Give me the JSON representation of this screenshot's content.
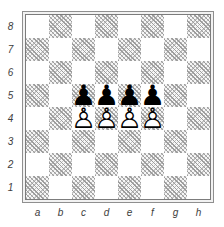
{
  "diagram": {
    "type": "chess-position",
    "files_left_to_right": [
      "a",
      "b",
      "c",
      "d",
      "e",
      "f",
      "g",
      "h"
    ],
    "ranks_top_to_bottom": [
      "8",
      "7",
      "6",
      "5",
      "4",
      "3",
      "2",
      "1"
    ],
    "pieces": [
      {
        "square": "c5",
        "color": "black",
        "type": "pawn",
        "glyph_solid": "♟",
        "glyph_outline": "♙"
      },
      {
        "square": "d5",
        "color": "black",
        "type": "pawn",
        "glyph_solid": "♟",
        "glyph_outline": "♙"
      },
      {
        "square": "e5",
        "color": "black",
        "type": "pawn",
        "glyph_solid": "♟",
        "glyph_outline": "♙"
      },
      {
        "square": "f5",
        "color": "black",
        "type": "pawn",
        "glyph_solid": "♟",
        "glyph_outline": "♙"
      },
      {
        "square": "c4",
        "color": "white",
        "type": "pawn",
        "glyph_solid": "♟",
        "glyph_outline": "♙"
      },
      {
        "square": "d4",
        "color": "white",
        "type": "pawn",
        "glyph_solid": "♟",
        "glyph_outline": "♙"
      },
      {
        "square": "e4",
        "color": "white",
        "type": "pawn",
        "glyph_solid": "♟",
        "glyph_outline": "♙"
      },
      {
        "square": "f4",
        "color": "white",
        "type": "pawn",
        "glyph_solid": "♟",
        "glyph_outline": "♙"
      }
    ],
    "colors": {
      "light_square": "#ffffff",
      "dark_square_background": "#f6f6f6",
      "dark_square_hatch_primary": "#9d9d9d",
      "dark_square_hatch_secondary": "#c2c2c2",
      "frame_outer_line": "#8f8f8f",
      "frame_inner_line": "#7c7c7c",
      "label_text": "#3d3d3d",
      "black_piece": "#000000",
      "white_piece_fill": "#ffffff",
      "white_piece_outline": "#000000"
    }
  }
}
